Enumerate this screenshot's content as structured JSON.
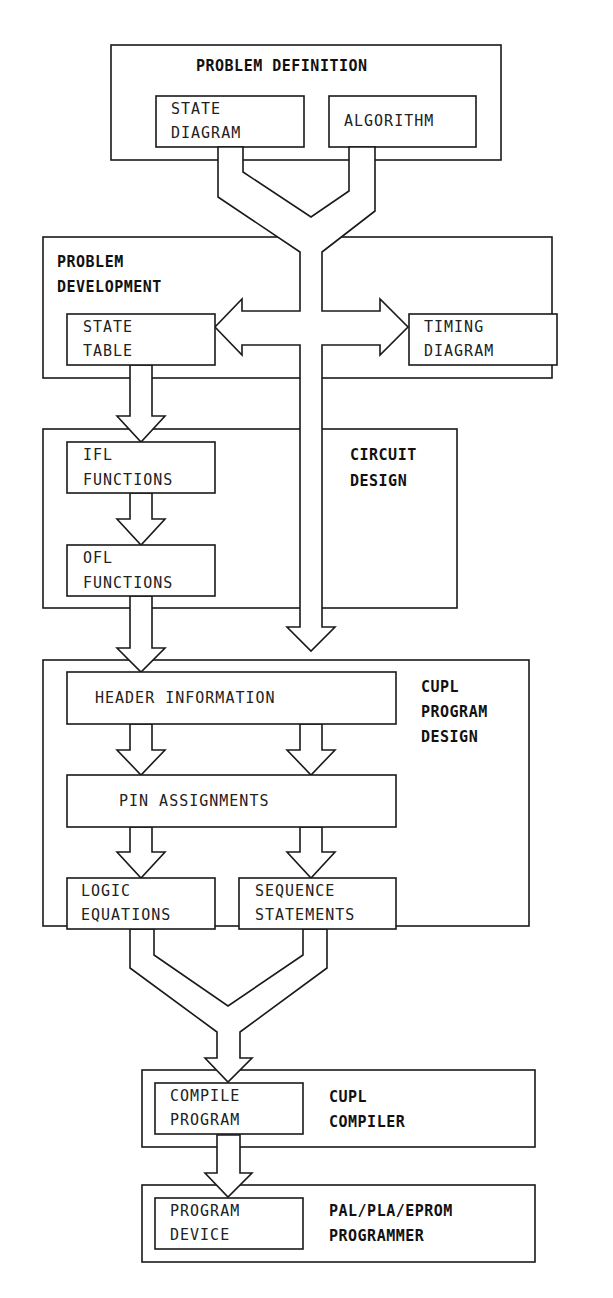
{
  "page_header": {
    "left": "MENT SEQUENCE",
    "right": "155"
  },
  "stages": {
    "problem_definition": {
      "title": "PROBLEM DEFINITION",
      "items": [
        {
          "line1": "STATE",
          "line2": "DIAGRAM"
        },
        {
          "line1": "ALGORITHM",
          "line2": ""
        }
      ]
    },
    "problem_development": {
      "title_line1": "PROBLEM",
      "title_line2": "DEVELOPMENT",
      "items": [
        {
          "line1": "STATE",
          "line2": "TABLE"
        },
        {
          "line1": "TIMING",
          "line2": "DIAGRAM"
        }
      ]
    },
    "circuit_design": {
      "title_line1": "CIRCUIT",
      "title_line2": "DESIGN",
      "items": [
        {
          "line1": "IFL",
          "line2": "FUNCTIONS"
        },
        {
          "line1": "OFL",
          "line2": "FUNCTIONS"
        }
      ]
    },
    "cupl_program_design": {
      "title_line1": "CUPL",
      "title_line2": "PROGRAM",
      "title_line3": "DESIGN",
      "items": [
        {
          "line1": "HEADER INFORMATION"
        },
        {
          "line1": "PIN ASSIGNMENTS"
        },
        {
          "line1": "LOGIC",
          "line2": "EQUATIONS"
        },
        {
          "line1": "SEQUENCE",
          "line2": "STATEMENTS"
        }
      ]
    },
    "cupl_compiler": {
      "title_line1": "CUPL",
      "title_line2": "COMPILER",
      "items": [
        {
          "line1": "COMPILE",
          "line2": "PROGRAM"
        }
      ]
    },
    "programmer": {
      "title_line1": "PAL/PLA/EPROM",
      "title_line2": "PROGRAMMER",
      "items": [
        {
          "line1": "PROGRAM",
          "line2": "DEVICE"
        }
      ]
    }
  },
  "colors": {
    "line": "#1a1a1a",
    "background": "#ffffff"
  }
}
